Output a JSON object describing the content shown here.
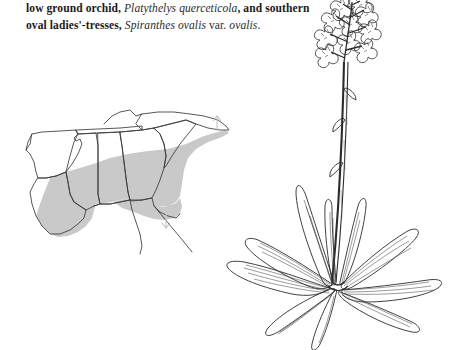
{
  "page": {
    "background_color": "#ffffff",
    "text_color": "#1a1a1a"
  },
  "caption": {
    "line1_part1": "low ground orchid,",
    "line1_species": "Platythelys querceticola",
    "line1_part2": ", and southern",
    "line2_part1": "oval ladies'-tresses,",
    "line2_species": "Spiranthes ovalis",
    "line2_rank": "var.",
    "line2_variety": "ovalis",
    "line2_end": "."
  },
  "map": {
    "name": "southeastern-us-distribution-map",
    "range_fill_color": "#c9c9c9",
    "outline_color": "#3a3a3a",
    "marker_color": "#c4c4c4",
    "states": [
      {
        "code": "AR",
        "name": "Arkansas",
        "shaded": "partial"
      },
      {
        "code": "LA",
        "name": "Louisiana",
        "shaded": "full"
      },
      {
        "code": "MS",
        "name": "Mississippi",
        "shaded": "full"
      },
      {
        "code": "AL",
        "name": "Alabama",
        "shaded": "full"
      },
      {
        "code": "GA",
        "name": "Georgia",
        "shaded": "full"
      },
      {
        "code": "SC",
        "name": "South Carolina",
        "shaded": "full"
      },
      {
        "code": "NC",
        "name": "North Carolina",
        "shaded": "partial"
      },
      {
        "code": "TN",
        "name": "Tennessee",
        "shaded": "partial"
      },
      {
        "code": "FL",
        "name": "Florida",
        "shaded": "partial"
      }
    ],
    "markers": [
      {
        "name": "arrow-marker-northeast",
        "direction": "up"
      },
      {
        "name": "arrow-marker-south",
        "direction": "down"
      }
    ]
  },
  "plant": {
    "name": "orchid-line-illustration",
    "medium": "pen-and-ink line drawing",
    "ink_color": "#2b2b2b",
    "parts": [
      {
        "name": "inflorescence",
        "label": "flower cluster (raceme)"
      },
      {
        "name": "flowers",
        "label": "small orchid flowers"
      },
      {
        "name": "stem",
        "label": "slender erect stem"
      },
      {
        "name": "bracts",
        "label": "stem bracts"
      },
      {
        "name": "basal-rosette",
        "label": "basal rosette of leaves"
      },
      {
        "name": "leaves",
        "label": "lanceolate veined leaves"
      }
    ]
  }
}
